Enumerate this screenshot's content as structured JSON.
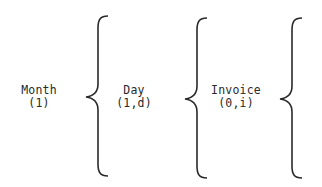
{
  "diagram": {
    "type": "warnier-orr hierarchy",
    "nodes": [
      {
        "name": "Month",
        "repetition": "(1)"
      },
      {
        "name": "Day",
        "repetition": "(1,d)"
      },
      {
        "name": "Invoice",
        "repetition": "(0,i)"
      }
    ],
    "connector": "left-curly-brace",
    "stroke_color": "#2a2a2a"
  }
}
